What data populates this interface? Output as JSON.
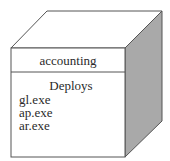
{
  "node": {
    "name": "accounting",
    "section_title": "Deploys",
    "artifacts": [
      "gl.exe",
      "ap.exe",
      "ar.exe"
    ]
  },
  "colors": {
    "side_face": "#a9a9a9",
    "top_face": "#ffffff",
    "front_face": "#ffffff",
    "outline": "#555555"
  }
}
